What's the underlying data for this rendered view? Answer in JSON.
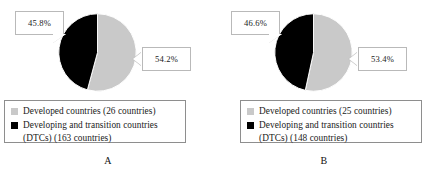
{
  "figure": {
    "background": "#ffffff",
    "developed_color": "#c9c9c9",
    "dtc_color": "#000000"
  },
  "panels": [
    {
      "id": "A",
      "letter": "A",
      "callout_left": "45.8%",
      "callout_right": "54.2%",
      "legend": [
        {
          "swatch": "developed-swatch",
          "color": "#c9c9c9",
          "label": "Developed countries (26 countries)"
        },
        {
          "swatch": "dtc-swatch",
          "color": "#000000",
          "label": "Developing and transition countries\n(DTCs) (163 countries)"
        }
      ],
      "chart_data": {
        "type": "pie",
        "title": "A",
        "categories": [
          "Developed countries (26 countries)",
          "Developing and transition countries (DTCs) (163 countries)"
        ],
        "values": [
          54.2,
          45.8
        ],
        "counts": [
          26,
          163
        ],
        "data_labels": [
          "54.2%",
          "45.8%"
        ],
        "colors": [
          "#c9c9c9",
          "#000000"
        ],
        "units": "percent",
        "start_angle": 0,
        "direction": "clockwise",
        "legend_position": "bottom",
        "grid": false
      }
    },
    {
      "id": "B",
      "letter": "B",
      "callout_left": "46.6%",
      "callout_right": "53.4%",
      "legend": [
        {
          "swatch": "developed-swatch",
          "color": "#c9c9c9",
          "label": "Developed countries (25 countries)"
        },
        {
          "swatch": "dtc-swatch",
          "color": "#000000",
          "label": "Developing and transition countries\n(DTCs) (148 countries)"
        }
      ],
      "chart_data": {
        "type": "pie",
        "title": "B",
        "categories": [
          "Developed countries (25 countries)",
          "Developing and transition countries (DTCs) (148 countries)"
        ],
        "values": [
          53.4,
          46.6
        ],
        "counts": [
          25,
          148
        ],
        "data_labels": [
          "53.4%",
          "46.6%"
        ],
        "colors": [
          "#c9c9c9",
          "#000000"
        ],
        "units": "percent",
        "start_angle": 0,
        "direction": "clockwise",
        "legend_position": "bottom",
        "grid": false
      }
    }
  ]
}
